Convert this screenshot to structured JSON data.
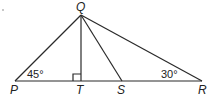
{
  "diagram": {
    "type": "geometry-triangle",
    "points": {
      "Q": {
        "label": "Q",
        "x": 81,
        "y": 15
      },
      "P": {
        "label": "P",
        "x": 15,
        "y": 81
      },
      "T": {
        "label": "T",
        "x": 81,
        "y": 81
      },
      "S": {
        "label": "S",
        "x": 122,
        "y": 81
      },
      "R": {
        "label": "R",
        "x": 202,
        "y": 81
      }
    },
    "segments": [
      "PQ",
      "QR",
      "PR",
      "QT",
      "QS"
    ],
    "angles": {
      "P": {
        "value": "45°"
      },
      "R": {
        "value": "30°"
      },
      "T": {
        "right_angle": true
      }
    },
    "colors": {
      "line": "#2a2a2a",
      "background": "#ffffff"
    }
  }
}
